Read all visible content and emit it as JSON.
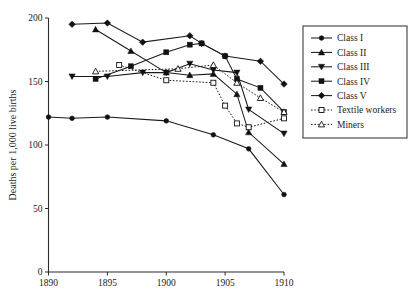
{
  "chart_data": {
    "type": "line",
    "title": "",
    "subtitle": "",
    "xlabel": "",
    "ylabel": "Deaths per 1,000 live births",
    "xlim": [
      1890,
      1910
    ],
    "ylim": [
      0,
      200
    ],
    "xticks": [
      1890,
      1895,
      1900,
      1905,
      1910
    ],
    "yticks": [
      0,
      50,
      100,
      150,
      200
    ],
    "xtick_labels": [
      "1890",
      "1895",
      "1900",
      "1905",
      "1910"
    ],
    "ytick_labels": [
      "0",
      "50",
      "100",
      "150",
      "200"
    ],
    "grid": false,
    "legend_position": "right",
    "series": [
      {
        "name": "Class I",
        "marker": "circle",
        "marker_fill": "filled",
        "line_style": "solid",
        "x": [
          1890,
          1892,
          1895,
          1900,
          1904,
          1907,
          1910
        ],
        "y": [
          122,
          121,
          122,
          119,
          108,
          97,
          61
        ]
      },
      {
        "name": "Class II",
        "marker": "triangle-up",
        "marker_fill": "filled",
        "line_style": "solid",
        "x": [
          1894,
          1897,
          1900,
          1902,
          1904,
          1906,
          1907,
          1910
        ],
        "y": [
          191,
          174,
          157,
          155,
          156,
          140,
          110,
          85
        ]
      },
      {
        "name": "Class III",
        "marker": "triangle-down",
        "marker_fill": "filled",
        "line_style": "solid",
        "x": [
          1892,
          1895,
          1898,
          1900,
          1902,
          1904,
          1906,
          1907,
          1910
        ],
        "y": [
          154,
          154,
          157,
          157,
          164,
          159,
          157,
          128,
          109
        ]
      },
      {
        "name": "Class IV",
        "marker": "square",
        "marker_fill": "filled",
        "line_style": "solid",
        "x": [
          1894,
          1897,
          1900,
          1902,
          1903,
          1905,
          1906,
          1908,
          1910
        ],
        "y": [
          152,
          162,
          173,
          179,
          180,
          170,
          152,
          145,
          126
        ]
      },
      {
        "name": "Class V",
        "marker": "diamond",
        "marker_fill": "filled",
        "line_style": "solid",
        "x": [
          1892,
          1895,
          1898,
          1902,
          1903,
          1905,
          1908,
          1910
        ],
        "y": [
          195,
          196,
          181,
          186,
          180,
          170,
          166,
          148
        ]
      },
      {
        "name": "Textile workers",
        "marker": "square",
        "marker_fill": "open",
        "line_style": "dotted",
        "x": [
          1896,
          1900,
          1904,
          1905,
          1906,
          1907,
          1910
        ],
        "y": [
          163,
          151,
          149,
          131,
          117,
          114,
          121
        ]
      },
      {
        "name": "Miners",
        "marker": "triangle-up",
        "marker_fill": "open",
        "line_style": "dotted",
        "x": [
          1894,
          1901,
          1904,
          1906,
          1908,
          1910
        ],
        "y": [
          158,
          160,
          163,
          149,
          137,
          126
        ]
      }
    ]
  },
  "legend": {
    "entries": [
      {
        "label": "Class I"
      },
      {
        "label": "Class II"
      },
      {
        "label": "Class III"
      },
      {
        "label": "Class IV"
      },
      {
        "label": "Class V"
      },
      {
        "label": "Textile workers"
      },
      {
        "label": "Miners"
      }
    ]
  }
}
